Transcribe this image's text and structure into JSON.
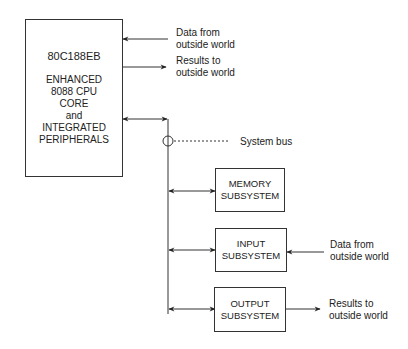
{
  "cpu": {
    "title": "80C188EB",
    "lines": [
      "ENHANCED",
      "8088 CPU",
      "CORE",
      "and",
      "INTEGRATED",
      "PERIPHERALS"
    ]
  },
  "cpu_io": {
    "input_label": [
      "Data from",
      "outside world"
    ],
    "output_label": [
      "Results to",
      "outside world"
    ]
  },
  "bus": {
    "label": "System bus"
  },
  "subsystems": [
    {
      "name": "memory",
      "lines": [
        "MEMORY",
        "SUBSYSTEM"
      ]
    },
    {
      "name": "input",
      "lines": [
        "INPUT",
        "SUBSYSTEM"
      ],
      "external_label": [
        "Data from",
        "outside world"
      ]
    },
    {
      "name": "output",
      "lines": [
        "OUTPUT",
        "SUBSYSTEM"
      ],
      "external_label": [
        "Results to",
        "outside world"
      ]
    }
  ]
}
